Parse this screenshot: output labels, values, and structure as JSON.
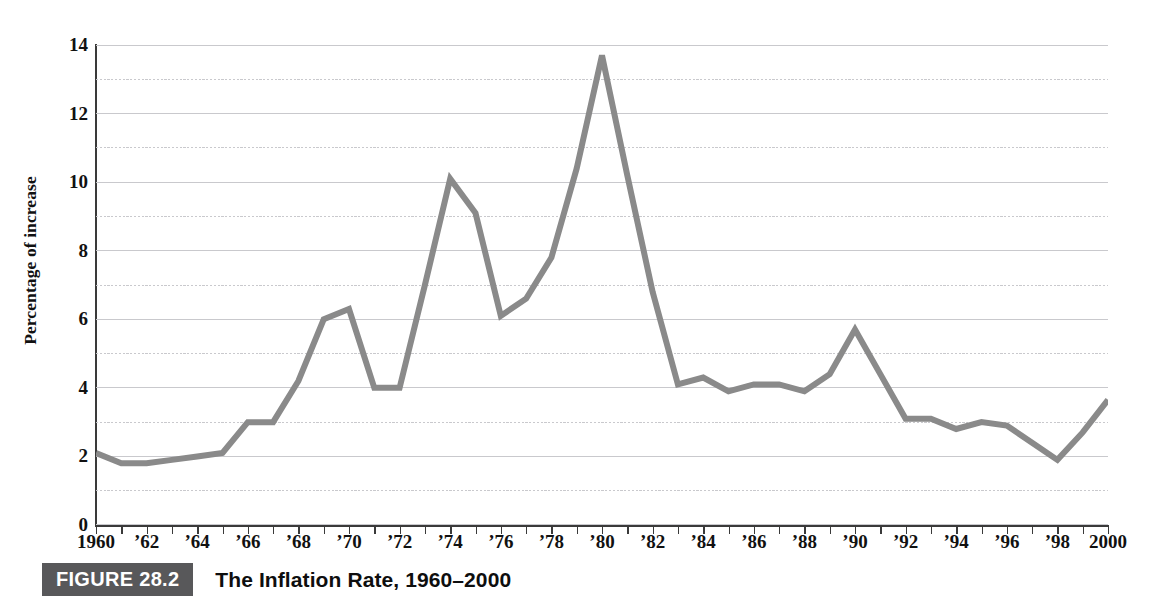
{
  "caption": {
    "figure_label": "FIGURE 28.2",
    "title": "The Inflation Rate, 1960–2000",
    "tag_bg": "#58585a"
  },
  "axis": {
    "y_title": "Percentage of increase"
  },
  "chart_data": {
    "type": "line",
    "title": "The Inflation Rate, 1960–2000",
    "xlabel": "",
    "ylabel": "Percentage of increase",
    "ylim": [
      0,
      14
    ],
    "xlim": [
      1960,
      2000
    ],
    "grid": true,
    "grid_interval": 1,
    "legend": "none",
    "line_color": "#8a8a8a",
    "line_width": 6,
    "y_ticks": [
      0,
      2,
      4,
      6,
      8,
      10,
      12,
      14
    ],
    "y_tick_labels": [
      "0",
      "2",
      "4",
      "6",
      "8",
      "10",
      "12",
      "14"
    ],
    "x_ticks": [
      1960,
      1962,
      1964,
      1966,
      1968,
      1970,
      1972,
      1974,
      1976,
      1978,
      1980,
      1982,
      1984,
      1986,
      1988,
      1990,
      1992,
      1994,
      1996,
      1998,
      2000
    ],
    "x_tick_labels": [
      "1960",
      "’62",
      "’64",
      "’66",
      "’68",
      "’70",
      "’72",
      "’74",
      "’76",
      "’78",
      "’80",
      "’82",
      "’84",
      "’86",
      "’88",
      "’90",
      "’92",
      "’94",
      "’96",
      "’98",
      "2000"
    ],
    "x": [
      1960,
      1961,
      1962,
      1963,
      1964,
      1965,
      1966,
      1967,
      1968,
      1969,
      1970,
      1971,
      1972,
      1973,
      1974,
      1975,
      1976,
      1977,
      1978,
      1979,
      1980,
      1981,
      1982,
      1983,
      1984,
      1985,
      1986,
      1987,
      1988,
      1989,
      1990,
      1991,
      1992,
      1993,
      1994,
      1995,
      1996,
      1997,
      1998,
      1999,
      2000
    ],
    "values": [
      2.1,
      1.8,
      1.8,
      1.9,
      2.0,
      2.1,
      3.0,
      3.0,
      4.2,
      6.0,
      6.3,
      4.0,
      4.0,
      7.0,
      10.1,
      9.1,
      6.1,
      6.6,
      7.8,
      10.4,
      13.7,
      10.2,
      6.8,
      4.1,
      4.3,
      3.9,
      4.1,
      4.1,
      3.9,
      4.4,
      5.7,
      4.4,
      3.1,
      3.1,
      2.8,
      3.0,
      2.9,
      2.4,
      1.9,
      2.7,
      3.65
    ]
  }
}
